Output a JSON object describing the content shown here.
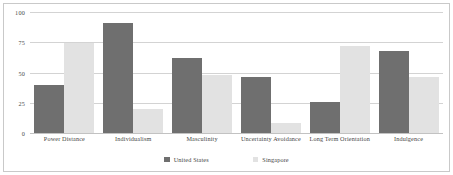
{
  "chart_data": {
    "type": "bar",
    "title": "",
    "subtitle": "",
    "xlabel": "",
    "ylabel": "",
    "ylim": [
      0,
      100
    ],
    "yticks": [
      100,
      75,
      50,
      25,
      0
    ],
    "grid": true,
    "legend_position": "bottom",
    "categories": [
      "Power Distance",
      "Individualism",
      "Masculinity",
      "Uncertainty Avoidance",
      "Long Term Orientation",
      "Indulgence"
    ],
    "series": [
      {
        "name": "United States",
        "color": "#6f6f6f",
        "values": [
          40,
          91,
          62,
          46,
          26,
          68
        ]
      },
      {
        "name": "Singapore",
        "color": "#e2e2e2",
        "values": [
          74,
          20,
          48,
          8,
          72,
          46
        ]
      }
    ]
  },
  "axis": {
    "y_tick_labels": [
      "100",
      "75",
      "50",
      "25",
      "0"
    ]
  },
  "legend": {
    "items": [
      {
        "label": "United States",
        "color": "#6f6f6f"
      },
      {
        "label": "Singapore",
        "color": "#e2e2e2"
      }
    ]
  }
}
